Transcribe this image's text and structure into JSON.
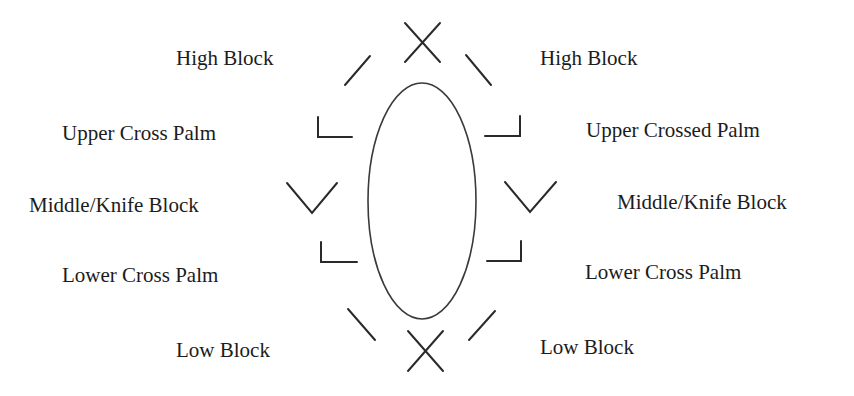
{
  "diagram": {
    "type": "blocking-positions",
    "center_shape": "ellipse",
    "colors": {
      "stroke": "#2a2a2a",
      "text": "#1c1c1c",
      "background": "#ffffff"
    },
    "left_labels": [
      {
        "id": "high",
        "label": "High Block"
      },
      {
        "id": "upper",
        "label": "Upper Cross Palm"
      },
      {
        "id": "middle",
        "label": "Middle/Knife Block"
      },
      {
        "id": "lower",
        "label": "Lower Cross Palm"
      },
      {
        "id": "low",
        "label": "Low Block"
      }
    ],
    "right_labels": [
      {
        "id": "high",
        "label": "High Block"
      },
      {
        "id": "upper",
        "label": "Upper Crossed Palm"
      },
      {
        "id": "middle",
        "label": "Middle/Knife Block"
      },
      {
        "id": "lower",
        "label": "Lower Cross Palm"
      },
      {
        "id": "low",
        "label": "Low Block"
      }
    ],
    "markers": {
      "top": "x-mark",
      "bottom": "x-mark",
      "high": "diagonal-line",
      "upper": "corner-bracket",
      "middle": "v-mark",
      "lower": "corner-bracket",
      "low": "diagonal-line"
    }
  }
}
